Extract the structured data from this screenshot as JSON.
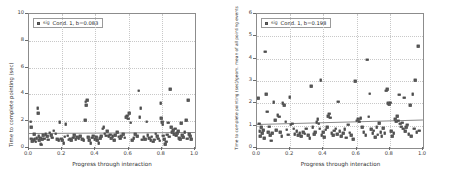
{
  "figure": {
    "background_color": "#ffffff",
    "marker_color": "#6e6e6e",
    "line_color": "#8a8a8a",
    "grid_color": "#c8c8c8",
    "axis_color": "#8c8c8c"
  },
  "chart_data": [
    {
      "type": "scatter",
      "panel": "left",
      "title": "",
      "xlabel": "Progress through interaction",
      "ylabel": "Time to complete pointing (sec)",
      "xlim": [
        0.0,
        1.0
      ],
      "ylim": [
        0,
        10
      ],
      "xticks": [
        0.0,
        0.2,
        0.4,
        0.6,
        0.8,
        1.0
      ],
      "xticklabels": [
        "0.0",
        "0.2",
        "0.4",
        "0.6",
        "0.8",
        "1.0"
      ],
      "yticks": [
        0,
        2,
        4,
        6,
        8,
        10
      ],
      "yticklabels": [
        "0",
        "2",
        "4",
        "6",
        "8",
        "10"
      ],
      "grid": true,
      "legend_position": "upper left",
      "legend": {
        "marker_tag": "sig",
        "label": "Cond. 1, b=0.083"
      },
      "fit_line": {
        "slope": 0.083,
        "intercept": 1.1,
        "x0": 0.0,
        "y0": 1.1,
        "x1": 1.0,
        "y1": 1.183
      },
      "points": [
        [
          0.01,
          1.95
        ],
        [
          0.012,
          1.55
        ],
        [
          0.015,
          0.7
        ],
        [
          0.018,
          0.52
        ],
        [
          0.022,
          0.62
        ],
        [
          0.028,
          0.58
        ],
        [
          0.031,
          1.02
        ],
        [
          0.035,
          0.66
        ],
        [
          0.04,
          0.48
        ],
        [
          0.046,
          0.72
        ],
        [
          0.052,
          2.98
        ],
        [
          0.054,
          2.6
        ],
        [
          0.058,
          0.86
        ],
        [
          0.062,
          0.58
        ],
        [
          0.066,
          0.72
        ],
        [
          0.07,
          0.33
        ],
        [
          0.074,
          0.25
        ],
        [
          0.08,
          0.64
        ],
        [
          0.086,
          0.94
        ],
        [
          0.092,
          0.7
        ],
        [
          0.1,
          1.02
        ],
        [
          0.108,
          0.86
        ],
        [
          0.116,
          0.62
        ],
        [
          0.124,
          1.14
        ],
        [
          0.132,
          0.96
        ],
        [
          0.14,
          0.78
        ],
        [
          0.15,
          1.28
        ],
        [
          0.16,
          1.08
        ],
        [
          0.17,
          0.66
        ],
        [
          0.178,
          0.58
        ],
        [
          0.186,
          1.92
        ],
        [
          0.194,
          0.7
        ],
        [
          0.2,
          0.58
        ],
        [
          0.208,
          0.36
        ],
        [
          0.214,
          0.84
        ],
        [
          0.222,
          1.76
        ],
        [
          0.232,
          0.92
        ],
        [
          0.24,
          0.62
        ],
        [
          0.248,
          0.7
        ],
        [
          0.256,
          0.56
        ],
        [
          0.266,
          0.78
        ],
        [
          0.274,
          0.96
        ],
        [
          0.282,
          0.64
        ],
        [
          0.292,
          0.82
        ],
        [
          0.3,
          0.72
        ],
        [
          0.31,
          0.88
        ],
        [
          0.32,
          0.66
        ],
        [
          0.33,
          0.58
        ],
        [
          0.338,
          2.08
        ],
        [
          0.342,
          3.44
        ],
        [
          0.346,
          3.18
        ],
        [
          0.35,
          3.56
        ],
        [
          0.356,
          0.8
        ],
        [
          0.364,
          0.6
        ],
        [
          0.372,
          0.34
        ],
        [
          0.38,
          0.76
        ],
        [
          0.388,
          0.92
        ],
        [
          0.396,
          0.64
        ],
        [
          0.404,
          0.82
        ],
        [
          0.412,
          0.56
        ],
        [
          0.42,
          0.38
        ],
        [
          0.428,
          0.74
        ],
        [
          0.436,
          0.86
        ],
        [
          0.444,
          1.44
        ],
        [
          0.45,
          1.56
        ],
        [
          0.456,
          1.08
        ],
        [
          0.464,
          0.92
        ],
        [
          0.472,
          1.24
        ],
        [
          0.48,
          0.86
        ],
        [
          0.488,
          1.0
        ],
        [
          0.496,
          0.72
        ],
        [
          0.504,
          0.88
        ],
        [
          0.512,
          0.6
        ],
        [
          0.52,
          0.96
        ],
        [
          0.53,
          1.2
        ],
        [
          0.54,
          0.84
        ],
        [
          0.548,
          0.68
        ],
        [
          0.556,
          0.9
        ],
        [
          0.566,
          1.02
        ],
        [
          0.576,
          0.76
        ],
        [
          0.586,
          2.32
        ],
        [
          0.592,
          2.42
        ],
        [
          0.598,
          2.2
        ],
        [
          0.604,
          2.6
        ],
        [
          0.612,
          1.9
        ],
        [
          0.62,
          0.58
        ],
        [
          0.63,
          0.72
        ],
        [
          0.64,
          1.02
        ],
        [
          0.652,
          0.86
        ],
        [
          0.662,
          4.28
        ],
        [
          0.668,
          2.3
        ],
        [
          0.674,
          2.96
        ],
        [
          0.682,
          0.62
        ],
        [
          0.69,
          0.8
        ],
        [
          0.7,
          0.66
        ],
        [
          0.71,
          1.96
        ],
        [
          0.716,
          0.94
        ],
        [
          0.724,
          0.74
        ],
        [
          0.732,
          0.58
        ],
        [
          0.74,
          0.84
        ],
        [
          0.748,
          0.46
        ],
        [
          0.756,
          0.62
        ],
        [
          0.764,
          1.06
        ],
        [
          0.772,
          0.88
        ],
        [
          0.78,
          0.7
        ],
        [
          0.788,
          0.54
        ],
        [
          0.794,
          3.36
        ],
        [
          0.798,
          2.22
        ],
        [
          0.802,
          1.92
        ],
        [
          0.806,
          1.74
        ],
        [
          0.81,
          0.92
        ],
        [
          0.816,
          0.64
        ],
        [
          0.822,
          0.3
        ],
        [
          0.828,
          0.48
        ],
        [
          0.834,
          1.0
        ],
        [
          0.84,
          1.88
        ],
        [
          0.846,
          0.84
        ],
        [
          0.852,
          4.38
        ],
        [
          0.858,
          1.56
        ],
        [
          0.864,
          1.18
        ],
        [
          0.87,
          1.32
        ],
        [
          0.876,
          1.04
        ],
        [
          0.882,
          1.44
        ],
        [
          0.888,
          0.92
        ],
        [
          0.894,
          1.12
        ],
        [
          0.9,
          1.26
        ],
        [
          0.906,
          0.74
        ],
        [
          0.912,
          0.66
        ],
        [
          0.918,
          1.86
        ],
        [
          0.924,
          0.96
        ],
        [
          0.93,
          0.82
        ],
        [
          0.938,
          1.2
        ],
        [
          0.946,
          2.06
        ],
        [
          0.952,
          0.7
        ],
        [
          0.958,
          3.58
        ],
        [
          0.964,
          1.02
        ],
        [
          0.97,
          0.86
        ],
        [
          0.976,
          0.64
        ]
      ]
    },
    {
      "type": "scatter",
      "panel": "right",
      "title": "",
      "xlabel": "Progress through interaction",
      "ylabel": "Time to complete pointing (sec)/geom. mean of all pointing events",
      "xlim": [
        0.0,
        1.0
      ],
      "ylim": [
        0,
        6
      ],
      "xticks": [
        0.0,
        0.2,
        0.4,
        0.6,
        0.8,
        1.0
      ],
      "xticklabels": [
        "0.0",
        "0.2",
        "0.4",
        "0.6",
        "0.8",
        "1.0"
      ],
      "yticks": [
        0,
        1,
        2,
        3,
        4,
        5,
        6
      ],
      "yticklabels": [
        "0",
        "1",
        "2",
        "3",
        "4",
        "5",
        "6"
      ],
      "grid": true,
      "legend_position": "upper left",
      "legend": {
        "marker_tag": "sig",
        "label": "Cond. 1, b=0.198"
      },
      "fit_line": {
        "slope": 0.198,
        "intercept": 1.06,
        "x0": 0.0,
        "y0": 1.06,
        "x1": 1.0,
        "y1": 1.258
      },
      "points": [
        [
          0.008,
          2.22
        ],
        [
          0.012,
          1.08
        ],
        [
          0.016,
          0.74
        ],
        [
          0.02,
          0.52
        ],
        [
          0.026,
          0.92
        ],
        [
          0.032,
          0.66
        ],
        [
          0.038,
          0.8
        ],
        [
          0.044,
          0.44
        ],
        [
          0.05,
          4.32
        ],
        [
          0.056,
          2.42
        ],
        [
          0.062,
          1.62
        ],
        [
          0.068,
          0.7
        ],
        [
          0.074,
          0.96
        ],
        [
          0.08,
          0.58
        ],
        [
          0.086,
          0.32
        ],
        [
          0.092,
          0.66
        ],
        [
          0.1,
          2.06
        ],
        [
          0.108,
          1.24
        ],
        [
          0.116,
          0.8
        ],
        [
          0.124,
          1.46
        ],
        [
          0.132,
          1.4
        ],
        [
          0.14,
          0.72
        ],
        [
          0.148,
          0.54
        ],
        [
          0.156,
          2.0
        ],
        [
          0.164,
          1.92
        ],
        [
          0.172,
          1.18
        ],
        [
          0.18,
          0.82
        ],
        [
          0.188,
          0.6
        ],
        [
          0.196,
          2.28
        ],
        [
          0.204,
          1.04
        ],
        [
          0.212,
          1.08
        ],
        [
          0.22,
          0.86
        ],
        [
          0.228,
          0.62
        ],
        [
          0.238,
          0.74
        ],
        [
          0.248,
          0.58
        ],
        [
          0.258,
          0.66
        ],
        [
          0.268,
          0.52
        ],
        [
          0.278,
          0.7
        ],
        [
          0.288,
          0.64
        ],
        [
          0.298,
          0.86
        ],
        [
          0.308,
          0.58
        ],
        [
          0.318,
          0.44
        ],
        [
          0.328,
          2.78
        ],
        [
          0.336,
          0.94
        ],
        [
          0.344,
          0.62
        ],
        [
          0.352,
          0.72
        ],
        [
          0.36,
          1.16
        ],
        [
          0.366,
          1.3
        ],
        [
          0.372,
          1.08
        ],
        [
          0.378,
          0.86
        ],
        [
          0.384,
          3.04
        ],
        [
          0.39,
          0.56
        ],
        [
          0.398,
          0.7
        ],
        [
          0.406,
          0.48
        ],
        [
          0.414,
          0.82
        ],
        [
          0.422,
          0.94
        ],
        [
          0.43,
          1.42
        ],
        [
          0.436,
          1.54
        ],
        [
          0.442,
          1.36
        ],
        [
          0.45,
          0.66
        ],
        [
          0.458,
          0.58
        ],
        [
          0.466,
          0.78
        ],
        [
          0.474,
          0.86
        ],
        [
          0.482,
          0.62
        ],
        [
          0.49,
          2.08
        ],
        [
          0.498,
          0.74
        ],
        [
          0.508,
          0.52
        ],
        [
          0.518,
          0.66
        ],
        [
          0.528,
          0.84
        ],
        [
          0.538,
          0.46
        ],
        [
          0.548,
          1.04
        ],
        [
          0.558,
          0.68
        ],
        [
          0.568,
          0.58
        ],
        [
          0.578,
          0.4
        ],
        [
          0.59,
          3.0
        ],
        [
          0.6,
          1.22
        ],
        [
          0.608,
          1.28
        ],
        [
          0.616,
          1.18
        ],
        [
          0.624,
          1.34
        ],
        [
          0.634,
          0.92
        ],
        [
          0.644,
          0.72
        ],
        [
          0.654,
          0.58
        ],
        [
          0.664,
          3.96
        ],
        [
          0.672,
          1.4
        ],
        [
          0.68,
          2.44
        ],
        [
          0.688,
          0.84
        ],
        [
          0.696,
          0.66
        ],
        [
          0.704,
          0.78
        ],
        [
          0.712,
          0.48
        ],
        [
          0.72,
          0.92
        ],
        [
          0.728,
          0.6
        ],
        [
          0.736,
          1.12
        ],
        [
          0.744,
          0.7
        ],
        [
          0.752,
          0.54
        ],
        [
          0.76,
          0.88
        ],
        [
          0.77,
          0.66
        ],
        [
          0.778,
          2.56
        ],
        [
          0.784,
          2.62
        ],
        [
          0.79,
          2.0
        ],
        [
          0.796,
          1.96
        ],
        [
          0.802,
          2.02
        ],
        [
          0.808,
          0.74
        ],
        [
          0.816,
          0.52
        ],
        [
          0.824,
          0.66
        ],
        [
          0.832,
          1.3
        ],
        [
          0.838,
          1.18
        ],
        [
          0.844,
          1.42
        ],
        [
          0.85,
          1.22
        ],
        [
          0.856,
          2.38
        ],
        [
          0.862,
          1.08
        ],
        [
          0.868,
          0.96
        ],
        [
          0.874,
          1.14
        ],
        [
          0.88,
          0.86
        ],
        [
          0.886,
          2.26
        ],
        [
          0.892,
          0.74
        ],
        [
          0.898,
          0.92
        ],
        [
          0.906,
          1.04
        ],
        [
          0.914,
          0.62
        ],
        [
          0.922,
          1.92
        ],
        [
          0.93,
          0.54
        ],
        [
          0.938,
          2.4
        ],
        [
          0.946,
          0.86
        ],
        [
          0.954,
          3.04
        ],
        [
          0.962,
          0.7
        ],
        [
          0.97,
          4.56
        ],
        [
          0.978,
          0.78
        ]
      ]
    }
  ]
}
